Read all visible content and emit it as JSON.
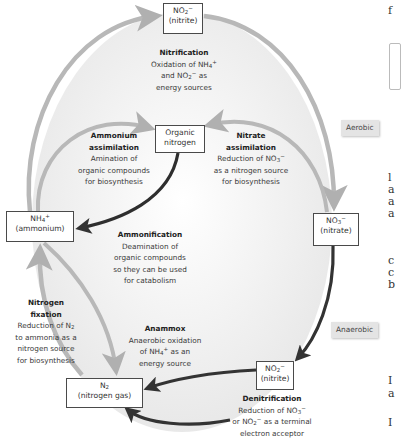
{
  "diagram": {
    "colors": {
      "light_arrow": "#b8b8b8",
      "dark_arrow": "#333333",
      "background_ellipse": "#eeeeee",
      "box_border": "#4a4a4a",
      "zone_label_bg": "#e4e4e4"
    },
    "nodes": {
      "nitrite_top": {
        "formula": "NO",
        "sub": "2",
        "sup": "−",
        "name": "(nitrite)"
      },
      "organic_nitrogen": {
        "line1": "Organic",
        "line2": "nitrogen"
      },
      "ammonium": {
        "formula": "NH",
        "sub": "4",
        "sup": "+",
        "name": "(ammonium)"
      },
      "nitrate": {
        "formula": "NO",
        "sub": "3",
        "sup": "−",
        "name": "(nitrate)"
      },
      "nitrite_bottom": {
        "formula": "NO",
        "sub": "2",
        "sup": "−",
        "name": "(nitrite)"
      },
      "nitrogen_gas": {
        "formula": "N",
        "sub": "2",
        "name": "(nitrogen gas)"
      }
    },
    "processes": {
      "nitrification": {
        "title": "Nitrification",
        "l1a": "Oxidation of NH",
        "l1sub": "4",
        "l1sup": "+",
        "l2a": "and NO",
        "l2sub": "2",
        "l2sup": "−",
        "l2b": " as",
        "l3": "energy sources"
      },
      "ammonium_assimilation": {
        "title1": "Ammonium",
        "title2": "assimilation",
        "l1": "Amination of",
        "l2": "organic compounds",
        "l3": "for biosynthesis"
      },
      "nitrate_assimilation": {
        "title1": "Nitrate",
        "title2": "assimilation",
        "l1a": "Reduction of NO",
        "l1sub": "3",
        "l1sup": "−",
        "l2": "as a nitrogen source",
        "l3": "for biosynthesis"
      },
      "ammonification": {
        "title": "Ammonification",
        "l1": "Deamination of",
        "l2": "organic compounds",
        "l3": "so they can be used",
        "l4": "for catabolism"
      },
      "nitrogen_fixation": {
        "title1": "Nitrogen",
        "title2": "fixation",
        "l1a": "Reduction of N",
        "l1sub": "2",
        "l2": "to ammonia as a",
        "l3": "nitrogen source",
        "l4": "for biosynthesis"
      },
      "anammox": {
        "title": "Anammox",
        "l1": "Anaerobic oxidation",
        "l2a": "of NH",
        "l2sub": "4",
        "l2sup": "+",
        "l2b": " as an",
        "l3": "energy source"
      },
      "denitrification": {
        "title": "Denitrification",
        "l1a": "Reduction of NO",
        "l1sub": "3",
        "l1sup": "−",
        "l2a": "or NO",
        "l2sub": "2",
        "l2sup": "−",
        "l2b": " as a terminal",
        "l3": "electron acceptor"
      }
    },
    "zones": {
      "aerobic": "Aerobic",
      "anaerobic": "Anaerobic"
    },
    "right_text_fragments": [
      "f",
      "l",
      "a",
      "a",
      "a",
      "c",
      "c",
      "b",
      "I",
      "a",
      "I"
    ]
  }
}
